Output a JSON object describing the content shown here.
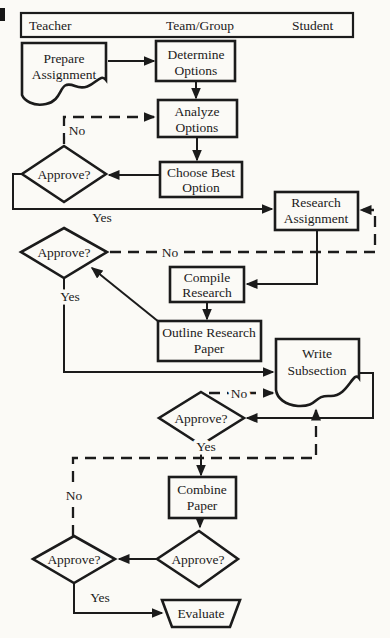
{
  "header": {
    "col1": "Teacher",
    "col2": "Team/Group",
    "col3": "Student"
  },
  "nodes": {
    "prepare": {
      "l1": "Prepare",
      "l2": "Assignment"
    },
    "determine": {
      "l1": "Determine",
      "l2": "Options"
    },
    "analyze": {
      "l1": "Analyze",
      "l2": "Options"
    },
    "choose": {
      "l1": "Choose Best",
      "l2": "Option"
    },
    "approve1": {
      "l1": "Approve?"
    },
    "research": {
      "l1": "Research",
      "l2": "Assignment"
    },
    "approve2": {
      "l1": "Approve?"
    },
    "compile": {
      "l1": "Compile",
      "l2": "Research"
    },
    "outline": {
      "l1": "Outline Research",
      "l2": "Paper"
    },
    "write": {
      "l1": "Write",
      "l2": "Subsection"
    },
    "approve3": {
      "l1": "Approve?"
    },
    "combine": {
      "l1": "Combine",
      "l2": "Paper"
    },
    "approve4": {
      "l1": "Approve?"
    },
    "approve5": {
      "l1": "Approve?"
    },
    "evaluate": {
      "l1": "Evaluate"
    }
  },
  "edge_labels": {
    "no1": "No",
    "yes1": "Yes",
    "no2": "No",
    "yes2": "Yes",
    "no3": "No",
    "yes3": "Yes",
    "no5": "No",
    "yes5": "Yes"
  }
}
